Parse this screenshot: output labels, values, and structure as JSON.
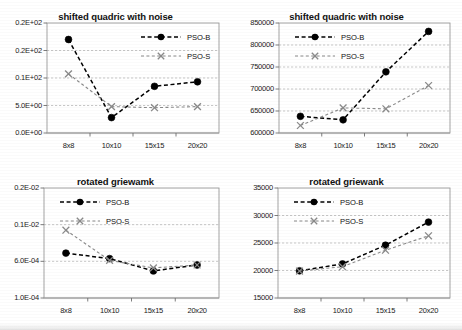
{
  "figure": {
    "layout": "2x2 grid of line charts",
    "panels": [
      "top-left",
      "top-right",
      "bottom-left",
      "bottom-right"
    ]
  },
  "series_style": {
    "pso_b_marker": "filled-circle",
    "pso_s_marker": "x-cross",
    "pso_b_color": "#000000",
    "pso_s_color": "#8a8a8a",
    "line_style": "dashed"
  },
  "chart_data": [
    {
      "id": "top-left",
      "type": "line",
      "title": "shifted quadric with noise",
      "xlabel": "",
      "ylabel": "",
      "categories": [
        "8x8",
        "10x10",
        "15x15",
        "20x20"
      ],
      "ytick_labels": [
        "0.2E+02",
        "0.2E+02",
        "0.1E+02",
        "5.0E+00",
        "0.0E+00"
      ],
      "ytick_values": [
        25,
        20,
        10,
        5,
        0
      ],
      "ylim": [
        0,
        25
      ],
      "grid": true,
      "legend": [
        "PSO-B",
        "PSO-S"
      ],
      "legend_position": "top-right-inside",
      "series": [
        {
          "name": "PSO-B",
          "values": [
            22.0,
            2.8,
            8.5,
            9.3
          ]
        },
        {
          "name": "PSO-S",
          "values": [
            11.5,
            4.8,
            4.6,
            4.8
          ]
        }
      ]
    },
    {
      "id": "top-right",
      "type": "line",
      "title": "shifted quadric with noise",
      "xlabel": "",
      "ylabel": "",
      "categories": [
        "8x8",
        "10x10",
        "15x15",
        "20x20"
      ],
      "ytick_labels": [
        "850000",
        "800000",
        "750000",
        "700000",
        "650000",
        "600000"
      ],
      "ytick_values": [
        850000,
        800000,
        750000,
        700000,
        650000,
        600000
      ],
      "ylim": [
        600000,
        850000
      ],
      "grid": true,
      "legend": [
        "PSO-B",
        "PSO-S"
      ],
      "legend_position": "top-left-inside",
      "series": [
        {
          "name": "PSO-B",
          "values": [
            638000,
            630000,
            739000,
            831000
          ]
        },
        {
          "name": "PSO-S",
          "values": [
            617000,
            657000,
            655000,
            708000
          ]
        }
      ]
    },
    {
      "id": "bottom-left",
      "type": "line",
      "title": "rotated griewamk",
      "xlabel": "",
      "ylabel": "",
      "categories": [
        "8x8",
        "10x10",
        "15x15",
        "20x20"
      ],
      "ytick_labels": [
        "0.2E-02",
        "0.1E-02",
        "6.0E-04",
        "1.0E-04"
      ],
      "ytick_values": [
        0.002,
        0.001,
        0.0006,
        0.0001
      ],
      "ylim": [
        0.0001,
        0.002
      ],
      "grid": true,
      "legend": [
        "PSO-B",
        "PSO-S"
      ],
      "legend_position": "top-left-inside",
      "series": [
        {
          "name": "PSO-B",
          "values": [
            0.00069,
            0.00063,
            0.00047,
            0.00055
          ]
        },
        {
          "name": "PSO-S",
          "values": [
            0.00094,
            0.00061,
            0.00051,
            0.00055
          ]
        }
      ]
    },
    {
      "id": "bottom-right",
      "type": "line",
      "title": "rotated griewank",
      "xlabel": "",
      "ylabel": "",
      "categories": [
        "8x8",
        "10x10",
        "15x15",
        "20x20"
      ],
      "ytick_labels": [
        "35000",
        "30000",
        "25000",
        "20000",
        "15000"
      ],
      "ytick_values": [
        35000,
        30000,
        25000,
        20000,
        15000
      ],
      "ylim": [
        15000,
        35000
      ],
      "grid": true,
      "legend": [
        "PSO-B",
        "PSO-S"
      ],
      "legend_position": "top-left-inside",
      "series": [
        {
          "name": "PSO-B",
          "values": [
            19950,
            21200,
            24600,
            28800
          ]
        },
        {
          "name": "PSO-S",
          "values": [
            19900,
            20700,
            23700,
            26300
          ]
        }
      ]
    }
  ]
}
